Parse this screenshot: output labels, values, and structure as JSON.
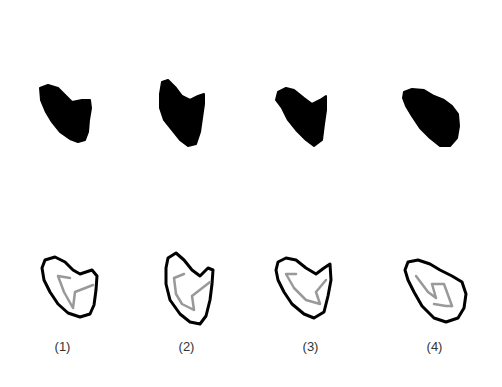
{
  "figure": {
    "panels": [
      {
        "label": "(1)"
      },
      {
        "label": "(2)"
      },
      {
        "label": "(3)"
      },
      {
        "label": "(4)"
      }
    ],
    "colors": {
      "silhouette": "#000000",
      "outline": "#000000",
      "skeleton": "#999999",
      "background": "#ffffff",
      "label": "#333333"
    }
  }
}
